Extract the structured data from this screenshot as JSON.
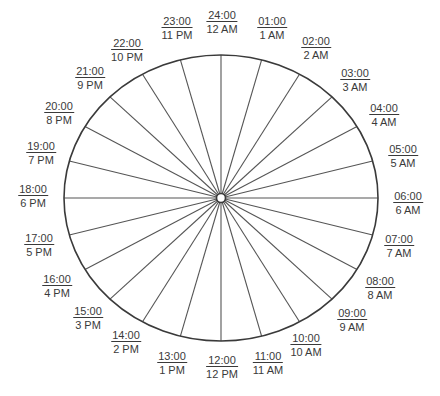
{
  "diagram": {
    "center": {
      "x": 221,
      "y": 198
    },
    "rx": 157,
    "ry": 143,
    "line_color": "#3a3a3a",
    "hours": [
      {
        "t24": "24:00",
        "t12": "12 AM",
        "x": 222,
        "y": 22
      },
      {
        "t24": "01:00",
        "t12": "1 AM",
        "x": 272,
        "y": 28
      },
      {
        "t24": "02:00",
        "t12": "2 AM",
        "x": 316,
        "y": 48
      },
      {
        "t24": "03:00",
        "t12": "3 AM",
        "x": 355,
        "y": 80
      },
      {
        "t24": "04:00",
        "t12": "4 AM",
        "x": 384,
        "y": 115
      },
      {
        "t24": "05:00",
        "t12": "5 AM",
        "x": 403,
        "y": 156
      },
      {
        "t24": "06:00",
        "t12": "6 AM",
        "x": 408,
        "y": 203
      },
      {
        "t24": "07:00",
        "t12": "7 AM",
        "x": 399,
        "y": 246
      },
      {
        "t24": "08:00",
        "t12": "8 AM",
        "x": 380,
        "y": 288
      },
      {
        "t24": "09:00",
        "t12": "9 AM",
        "x": 352,
        "y": 320
      },
      {
        "t24": "10:00",
        "t12": "10 AM",
        "x": 306,
        "y": 345
      },
      {
        "t24": "11:00",
        "t12": "11 AM",
        "x": 268,
        "y": 363
      },
      {
        "t24": "12:00",
        "t12": "12 PM",
        "x": 222,
        "y": 367
      },
      {
        "t24": "13:00",
        "t12": "1 PM",
        "x": 172,
        "y": 363
      },
      {
        "t24": "14:00",
        "t12": "2 PM",
        "x": 126,
        "y": 342
      },
      {
        "t24": "15:00",
        "t12": "3 PM",
        "x": 88,
        "y": 318
      },
      {
        "t24": "16:00",
        "t12": "4 PM",
        "x": 57,
        "y": 286
      },
      {
        "t24": "17:00",
        "t12": "5 PM",
        "x": 39,
        "y": 245
      },
      {
        "t24": "18:00",
        "t12": "6 PM",
        "x": 33,
        "y": 196
      },
      {
        "t24": "19:00",
        "t12": "7 PM",
        "x": 41,
        "y": 153
      },
      {
        "t24": "20:00",
        "t12": "8 PM",
        "x": 59,
        "y": 113
      },
      {
        "t24": "21:00",
        "t12": "9 PM",
        "x": 90,
        "y": 78
      },
      {
        "t24": "22:00",
        "t12": "10 PM",
        "x": 127,
        "y": 50
      },
      {
        "t24": "23:00",
        "t12": "11 PM",
        "x": 177,
        "y": 28
      }
    ]
  }
}
